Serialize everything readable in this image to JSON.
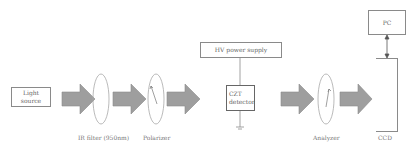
{
  "diagram": {
    "title": "",
    "nodes": {
      "light_source": {
        "line1": "Light",
        "line2": "source"
      },
      "ir_filter": {
        "label": "IR filter (950nm)"
      },
      "polarizer": {
        "label": "Polarizer"
      },
      "hv_power_supply": {
        "label": "HV power supply"
      },
      "czt_detector": {
        "line1": "CZT",
        "line2": "detector"
      },
      "analyzer": {
        "label": "Analyzer"
      },
      "ccd": {
        "label": "CCD"
      },
      "pc": {
        "label": "PC"
      }
    },
    "edges": [
      {
        "from": "light_source",
        "to": "ir_filter",
        "type": "block-arrow"
      },
      {
        "from": "ir_filter",
        "to": "polarizer",
        "type": "block-arrow"
      },
      {
        "from": "polarizer",
        "to": "czt_detector",
        "type": "block-arrow"
      },
      {
        "from": "hv_power_supply",
        "to": "czt_detector",
        "type": "line"
      },
      {
        "from": "czt_detector",
        "to": "ground",
        "type": "line"
      },
      {
        "from": "czt_detector",
        "to": "analyzer",
        "type": "block-arrow"
      },
      {
        "from": "analyzer",
        "to": "ccd",
        "type": "block-arrow"
      },
      {
        "from": "ccd",
        "to": "pc",
        "type": "double-arrow"
      }
    ],
    "colors": {
      "arrow_fill": "#9a9a9a",
      "stroke": "#8a8a8a",
      "ellipse": "#a0a0a0"
    }
  }
}
